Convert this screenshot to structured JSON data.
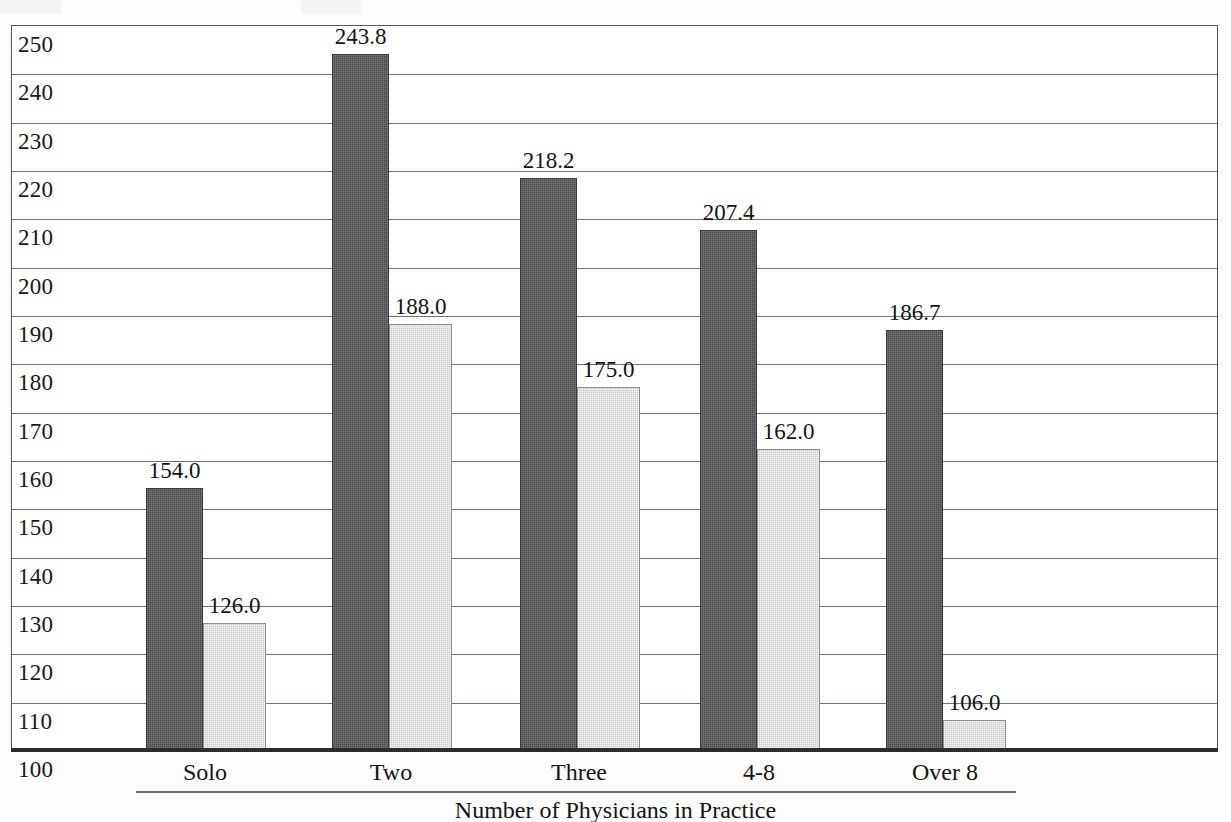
{
  "chart_data": {
    "type": "bar",
    "title": "",
    "xlabel": "Number of Physicians in Practice",
    "ylabel": "",
    "categories": [
      "Solo",
      "Two",
      "Three",
      "4-8",
      "Over 8"
    ],
    "series": [
      {
        "name": "series-1",
        "values": [
          154.0,
          243.8,
          218.2,
          207.4,
          186.7
        ],
        "color": "#4a4a4c",
        "fill": "dark-gray-dither"
      },
      {
        "name": "series-2",
        "values": [
          126.0,
          188.0,
          175.0,
          162.0,
          106.0
        ],
        "color": "#c7c7c7",
        "fill": "light-gray-dither"
      }
    ],
    "value_labels": {
      "series-1": [
        "154.0",
        "243.8",
        "218.2",
        "207.4",
        "186.7"
      ],
      "series-2": [
        "126.0",
        "188.0",
        "175.0",
        "162.0",
        "106.0"
      ]
    },
    "ylim": [
      100,
      250
    ],
    "ytick_step": 10,
    "yticks": [
      250,
      240,
      230,
      220,
      210,
      200,
      190,
      180,
      170,
      160,
      150,
      140,
      130,
      120,
      110,
      100
    ],
    "ytick_labels": [
      "250",
      "240",
      "230",
      "220",
      "210",
      "200",
      "190",
      "180",
      "170",
      "160",
      "150",
      "140",
      "130",
      "120",
      "110",
      "100"
    ],
    "grid": true,
    "grid_axis": "y",
    "legend": "none",
    "legend_position": "none"
  },
  "axis": {
    "x_title": "Number of Physicians in Practice"
  },
  "colors": {
    "series_1": "#4a4a4c",
    "series_2": "#c7c7c7",
    "gridline": "#6f7477",
    "frame": "#55595c",
    "baseline": "#2c2c2e",
    "text": "#141416"
  }
}
